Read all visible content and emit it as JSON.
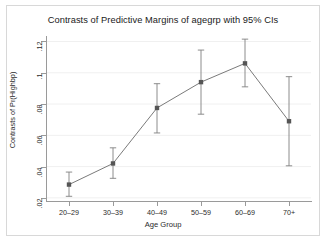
{
  "chart_data": {
    "type": "line",
    "title": "Contrasts of Predictive Margins of agegrp with 95% CIs",
    "xlabel": "Age Group",
    "ylabel": "Contrasts of Pr(Highbp)",
    "categories": [
      "20–29",
      "30–39",
      "40–49",
      "50–59",
      "60–69",
      "70+"
    ],
    "values": [
      0.0285,
      0.042,
      0.0775,
      0.094,
      0.106,
      0.069
    ],
    "ci_lower": [
      0.021,
      0.0325,
      0.0615,
      0.0735,
      0.091,
      0.0405
    ],
    "ci_upper": [
      0.0365,
      0.052,
      0.093,
      0.1145,
      0.1215,
      0.0975
    ],
    "ylim": [
      0.018,
      0.1235
    ],
    "ytick_values": [
      0.12,
      0.1,
      0.08,
      0.06,
      0.04,
      0.02
    ],
    "ytick_labels": [
      ".12",
      ".1",
      ".08",
      ".06",
      ".04",
      ".02"
    ],
    "grid": true,
    "grid_axis": "y",
    "legend": "none",
    "marker": "square",
    "series_color": "#6b6b6b",
    "marker_color": "#555555",
    "errorbar_color": "#808080",
    "grid_color": "#f0f0f0",
    "axis_color": "#9a9a9a",
    "background": "#ffffff"
  },
  "figure": {
    "title": "Contrasts of Predictive Margins of agegrp with 95% CIs",
    "x_axis_title": "Age Group",
    "y_axis_title": "Contrasts of Pr(Highbp)"
  }
}
